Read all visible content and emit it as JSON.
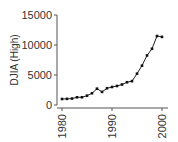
{
  "chart_data": {
    "type": "line",
    "title": "",
    "xlabel": "",
    "ylabel": "DJIA (High)",
    "x": [
      1980,
      1981,
      1982,
      1983,
      1984,
      1985,
      1986,
      1987,
      1988,
      1989,
      1990,
      1991,
      1992,
      1993,
      1994,
      1995,
      1996,
      1997,
      1998,
      1999,
      2000
    ],
    "values": [
      1000,
      1025,
      1071,
      1287,
      1287,
      1553,
      1956,
      2722,
      2184,
      2791,
      3000,
      3168,
      3413,
      3794,
      3978,
      5216,
      6560,
      8259,
      9374,
      11497,
      11350
    ],
    "xticks": [
      "1980",
      "1990",
      "2000"
    ],
    "yticks": [
      "0",
      "5000",
      "10000",
      "15000"
    ],
    "xlim": [
      1980,
      2000
    ],
    "ylim": [
      0,
      15000
    ],
    "grid": false,
    "legend": null
  }
}
